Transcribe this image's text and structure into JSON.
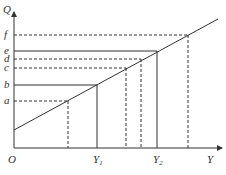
{
  "diagram": {
    "axes": {
      "y_label": "Q",
      "x_label": "Y",
      "origin_label": "O"
    },
    "y_levels": [
      {
        "label": "a",
        "style": "dashed",
        "y": 101,
        "x_end": 68
      },
      {
        "label": "b",
        "style": "solid",
        "y": 85,
        "x_end": 97
      },
      {
        "label": "c",
        "style": "dashed",
        "y": 68,
        "x_end": 126
      },
      {
        "label": "d",
        "style": "dashed",
        "y": 59,
        "x_end": 141
      },
      {
        "label": "e",
        "style": "solid",
        "y": 51,
        "x_end": 157
      },
      {
        "label": "f",
        "style": "dashed",
        "y": 35,
        "x_end": 188
      }
    ],
    "x_marks": [
      {
        "label": "",
        "style": "dashed",
        "x": 68
      },
      {
        "label": "Y",
        "sub": "1",
        "style": "solid",
        "x": 97
      },
      {
        "label": "",
        "style": "dashed",
        "x": 126
      },
      {
        "label": "",
        "style": "dashed",
        "x": 141
      },
      {
        "label": "Y",
        "sub": "2",
        "style": "solid",
        "x": 157
      },
      {
        "label": "",
        "style": "dashed",
        "x": 188
      }
    ],
    "line": {
      "x1": 14,
      "y1": 130,
      "x2": 218,
      "y2": 19
    },
    "colors": {
      "stroke": "#333333",
      "background": "#ffffff"
    }
  }
}
